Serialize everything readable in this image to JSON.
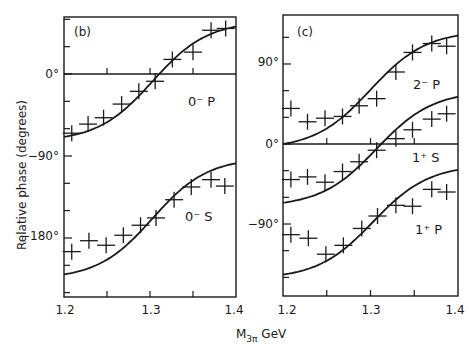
{
  "chart_data": [
    {
      "panel": "(b)",
      "type": "scatter",
      "xlabel": "M3π GeV",
      "ylabel": "Relative phase (degrees)",
      "xlim": [
        1.2,
        1.4
      ],
      "ylim": [
        -245,
        62
      ],
      "x_ticks": [
        1.2,
        1.3,
        1.4
      ],
      "x_minor_ticks": [
        1.25,
        1.35
      ],
      "y_tick_labels": [
        "0°",
        "-90°",
        "-180°"
      ],
      "y_ticks": [
        0,
        -90,
        -180
      ],
      "y_minor_step": 30,
      "grid": false,
      "reference_line": 0,
      "series": [
        {
          "name": "0⁻ P",
          "x": [
            1.209,
            1.228,
            1.246,
            1.267,
            1.287,
            1.306,
            1.326,
            1.35,
            1.371,
            1.388
          ],
          "values": [
            -65,
            -55,
            -48,
            -33,
            -19,
            -8,
            16,
            24,
            48,
            50
          ],
          "fit_curve": {
            "start": -69,
            "end": 52,
            "mid_x": 1.303
          }
        },
        {
          "name": "0⁻ S",
          "x": [
            1.209,
            1.229,
            1.249,
            1.269,
            1.289,
            1.307,
            1.328,
            1.348,
            1.371,
            1.387
          ],
          "values": [
            -195,
            -183,
            -188,
            -177,
            -166,
            -158,
            -138,
            -124,
            -116,
            -123
          ],
          "fit_curve": {
            "start": -220,
            "end": -98,
            "mid_x": 1.303
          }
        }
      ]
    },
    {
      "panel": "(c)",
      "type": "scatter",
      "xlabel": "M3π GeV",
      "ylabel": "Relative phase (degrees)",
      "xlim": [
        1.2,
        1.4
      ],
      "ylim": [
        -171,
        145
      ],
      "x_ticks": [
        1.2,
        1.3,
        1.4
      ],
      "x_minor_ticks": [
        1.25,
        1.35
      ],
      "y_tick_labels": [
        "90°",
        "0°",
        "-90°"
      ],
      "y_ticks": [
        90,
        0,
        -90
      ],
      "y_minor_step": 30,
      "grid": false,
      "reference_line": 0,
      "series": [
        {
          "name": "2⁻ P",
          "x": [
            1.209,
            1.228,
            1.248,
            1.268,
            1.287,
            1.307,
            1.329,
            1.348,
            1.37,
            1.387
          ],
          "values": [
            40,
            25,
            29,
            31,
            43,
            51,
            81,
            103,
            113,
            110
          ],
          "fit_curve": {
            "start": 0,
            "end": 122,
            "mid_x": 1.3
          }
        },
        {
          "name": "1⁺ S",
          "x": [
            1.209,
            1.228,
            1.248,
            1.268,
            1.287,
            1.307,
            1.329,
            1.348,
            1.37,
            1.387
          ],
          "values": [
            -40,
            -37,
            -43,
            -31,
            -20,
            -7,
            6,
            16,
            28,
            34
          ],
          "fit_curve": {
            "start": -66,
            "end": 53,
            "mid_x": 1.307
          }
        },
        {
          "name": "1⁺ P",
          "x": [
            1.209,
            1.229,
            1.249,
            1.269,
            1.29,
            1.308,
            1.329,
            1.348,
            1.37,
            1.387
          ],
          "values": [
            -102,
            -106,
            -124,
            -114,
            -95,
            -81,
            -69,
            -70,
            -51,
            -54
          ],
          "fit_curve": {
            "start": -147,
            "end": -29,
            "mid_x": 1.303
          }
        }
      ]
    }
  ],
  "labels": {
    "panel_b": "(b)",
    "panel_c": "(c)",
    "ylabel": "Relative phase  (degrees)",
    "xlabel_main": "M",
    "xlabel_sub": "3π",
    "xlabel_unit": " GeV",
    "x_tick_1": "1.2",
    "x_tick_2": "1.3",
    "x_tick_3": "1.4",
    "b_y_0": "0°",
    "b_y_m90": "−90°",
    "b_y_m180": "−180°",
    "c_y_90": "90°",
    "c_y_0": "0°",
    "c_y_m90": "−90°",
    "series_0mP": "0⁻ P",
    "series_0mS": "0⁻ S",
    "series_2mP": "2⁻ P",
    "series_1pS": "1⁺ S",
    "series_1pP": "1⁺ P"
  },
  "style": {
    "ink": "#1a1a1a",
    "background": "#ffffff"
  }
}
